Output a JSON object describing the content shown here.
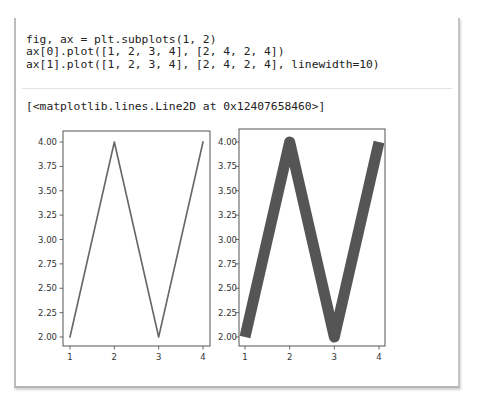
{
  "cell": {
    "code_lines": [
      "fig, ax = plt.subplots(1, 2)",
      "ax[0].plot([1, 2, 3, 4], [2, 4, 2, 4])",
      "ax[1].plot([1, 2, 3, 4], [2, 4, 2, 4], linewidth=10)"
    ],
    "output_text": "[<matplotlib.lines.Line2D at 0x12407658460>]"
  },
  "chart_data": [
    {
      "type": "line",
      "title": "",
      "xlabel": "",
      "ylabel": "",
      "x": [
        1,
        2,
        3,
        4
      ],
      "series": [
        {
          "name": "ax[0]",
          "values": [
            2,
            4,
            2,
            4
          ],
          "linewidth": 1.5
        }
      ],
      "xticks": [
        "1",
        "2",
        "3",
        "4"
      ],
      "yticks": [
        "2.00",
        "2.25",
        "2.50",
        "2.75",
        "3.00",
        "3.25",
        "3.50",
        "3.75",
        "4.00"
      ],
      "ylim": [
        1.9,
        4.1
      ],
      "grid": false,
      "line_color": "#666666"
    },
    {
      "type": "line",
      "title": "",
      "xlabel": "",
      "ylabel": "",
      "x": [
        1,
        2,
        3,
        4
      ],
      "series": [
        {
          "name": "ax[1]",
          "values": [
            2,
            4,
            2,
            4
          ],
          "linewidth": 10
        }
      ],
      "xticks": [
        "1",
        "2",
        "3",
        "4"
      ],
      "yticks": [
        "2.00",
        "2.25",
        "2.50",
        "2.75",
        "3.00",
        "3.25",
        "3.50",
        "3.75",
        "4.00"
      ],
      "ylim": [
        1.9,
        4.1
      ],
      "grid": false,
      "line_color": "#555555"
    }
  ]
}
